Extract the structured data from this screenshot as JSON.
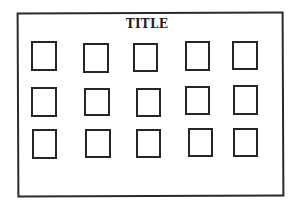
{
  "title": "TITLE",
  "colors": {
    "stroke": "#262626",
    "background": "#ffffff"
  },
  "grid": {
    "rows": 3,
    "cols": 5,
    "boxes": [
      {
        "x": 31,
        "y": 41,
        "w": 26,
        "h": 30
      },
      {
        "x": 83,
        "y": 43,
        "w": 26,
        "h": 30
      },
      {
        "x": 133,
        "y": 43,
        "w": 25,
        "h": 29
      },
      {
        "x": 185,
        "y": 41,
        "w": 25,
        "h": 30
      },
      {
        "x": 232,
        "y": 41,
        "w": 26,
        "h": 29
      },
      {
        "x": 31,
        "y": 87,
        "w": 26,
        "h": 30
      },
      {
        "x": 84,
        "y": 88,
        "w": 26,
        "h": 28
      },
      {
        "x": 136,
        "y": 88,
        "w": 25,
        "h": 29
      },
      {
        "x": 185,
        "y": 86,
        "w": 25,
        "h": 29
      },
      {
        "x": 233,
        "y": 85,
        "w": 25,
        "h": 30
      },
      {
        "x": 32,
        "y": 129,
        "w": 25,
        "h": 30
      },
      {
        "x": 85,
        "y": 129,
        "w": 26,
        "h": 29
      },
      {
        "x": 136,
        "y": 129,
        "w": 25,
        "h": 29
      },
      {
        "x": 188,
        "y": 128,
        "w": 25,
        "h": 29
      },
      {
        "x": 233,
        "y": 128,
        "w": 25,
        "h": 29
      }
    ]
  }
}
